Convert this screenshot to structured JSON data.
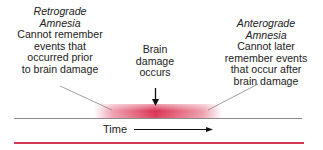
{
  "retrograde": {
    "title_line1": "Retrograde",
    "title_line2": "Amnesia",
    "desc_lines": [
      "Cannot remember",
      "events that",
      "occurred prior",
      "to brain damage"
    ]
  },
  "anterograde": {
    "title_line1": "Anterograde",
    "title_line2": "Amnesia",
    "desc_lines": [
      "Cannot later",
      "remember events",
      "that occur after",
      "brain damage"
    ]
  },
  "event": {
    "lines": [
      "Brain",
      "damage",
      "occurs"
    ]
  },
  "timeline": {
    "label": "Time"
  },
  "colors": {
    "accent_red": "#d8274a",
    "timeline_gray": "#8a8a8a",
    "text": "#222222"
  }
}
